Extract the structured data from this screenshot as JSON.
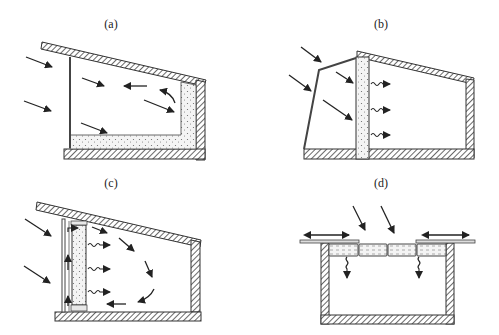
{
  "figure": {
    "panels": [
      {
        "id": "a",
        "label": "(a)",
        "description": "Direct gain: sunlight through glazing onto floor/wall thermal mass"
      },
      {
        "id": "b",
        "label": "(b)",
        "description": "Indirect gain: thermal storage wall behind glazing radiates heat into room"
      },
      {
        "id": "c",
        "label": "(c)",
        "description": "Trombe wall: storage wall with air gap and convective loop circulating air"
      },
      {
        "id": "d",
        "label": "(d)",
        "description": "Roof pond: water bags on roof with movable insulation panels"
      }
    ]
  },
  "colors": {
    "line": "#333333",
    "hatch": "#444444",
    "mass_fill": "#f2f2f2",
    "background": "#ffffff"
  }
}
